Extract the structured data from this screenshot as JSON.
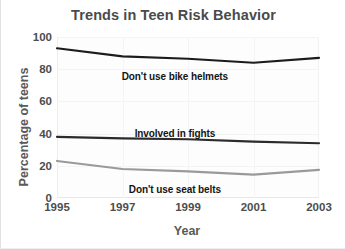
{
  "chart_data": {
    "type": "line",
    "title": "Trends in Teen Risk Behavior",
    "xlabel": "Year",
    "ylabel": "Percentage of teens",
    "x": [
      1995,
      1997,
      1999,
      2001,
      2003
    ],
    "xticklabels": [
      "1995",
      "1997",
      "1999",
      "2001",
      "2003"
    ],
    "yticks": [
      0,
      20,
      40,
      60,
      80,
      100
    ],
    "yticklabels": [
      "0",
      "20",
      "40",
      "60",
      "80",
      "100"
    ],
    "xlim": [
      1995,
      2003
    ],
    "ylim": [
      0,
      100
    ],
    "grid": true,
    "legend": "inline-labels",
    "series": [
      {
        "name": "Don't use bike helmets",
        "values": [
          93,
          88,
          86.5,
          84,
          87
        ],
        "color": "#1c1c1c",
        "label_x": 1998.6,
        "label_y": 79
      },
      {
        "name": "Involved in fights",
        "values": [
          38,
          37,
          36.5,
          35,
          34
        ],
        "color": "#2b2b2b",
        "label_x": 1998.6,
        "label_y": 43.5
      },
      {
        "name": "Don't use seat belts",
        "values": [
          23,
          18,
          16.5,
          14.5,
          17.5
        ],
        "color": "#9a9a9a",
        "label_x": 1998.6,
        "label_y": 8.5
      }
    ]
  }
}
